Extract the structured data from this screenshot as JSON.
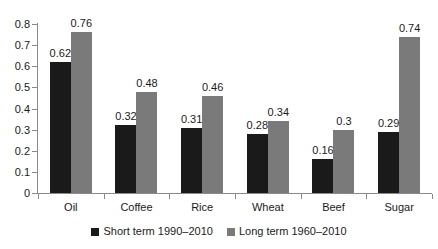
{
  "chart_data": {
    "type": "bar",
    "title": "",
    "subtitle": "",
    "xlabel": "",
    "ylabel": "",
    "ylim": [
      0,
      0.8
    ],
    "y_ticks": [
      "0",
      "0.1",
      "0.2",
      "0.3",
      "0.4",
      "0.5",
      "0.6",
      "0.7",
      "0.8"
    ],
    "y_tick_values": [
      0,
      0.1,
      0.2,
      0.3,
      0.4,
      0.5,
      0.6,
      0.7,
      0.8
    ],
    "categories": [
      "Oil",
      "Coffee",
      "Rice",
      "Wheat",
      "Beef",
      "Sugar"
    ],
    "grid": false,
    "legend_position": "bottom",
    "series": [
      {
        "name": "Short term 1990–2010",
        "color": "#1a1a1a",
        "values": [
          0.62,
          0.32,
          0.31,
          0.28,
          0.16,
          0.29
        ],
        "labels": [
          "0.62",
          "0.32",
          "0.31",
          "0.28",
          "0.16",
          "0.29"
        ]
      },
      {
        "name": "Long term 1960–2010",
        "color": "#7a7a7a",
        "values": [
          0.76,
          0.48,
          0.46,
          0.34,
          0.3,
          0.74
        ],
        "labels": [
          "0.76",
          "0.48",
          "0.46",
          "0.34",
          "0.3",
          "0.74"
        ]
      }
    ]
  },
  "axis": {
    "line_color": "#8a8a8a"
  },
  "legend": {
    "items": [
      {
        "label": "Short term 1990–2010",
        "color": "#1a1a1a"
      },
      {
        "label": "Long term 1960–2010",
        "color": "#7a7a7a"
      }
    ]
  }
}
